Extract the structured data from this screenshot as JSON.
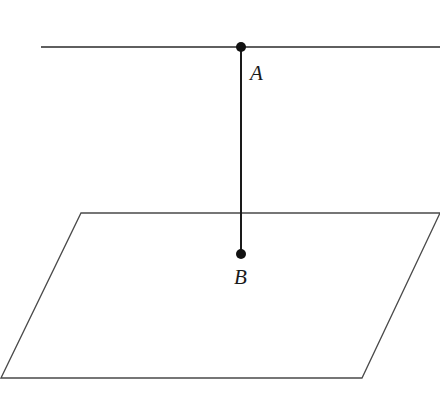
{
  "diagram": {
    "type": "geometry",
    "colors": {
      "stroke": "#2a2a2a",
      "plane_stroke": "#4a4a4a",
      "point_fill": "#111111",
      "background": "#ffffff"
    },
    "line": {
      "x1": 41,
      "y1": 47,
      "x2": 440,
      "y2": 47
    },
    "segment_AB": {
      "x1": 241,
      "y1": 47,
      "x2": 241,
      "y2": 254
    },
    "plane": {
      "points": "81,213 440,213 362,378 1,378"
    },
    "points": [
      {
        "id": "A",
        "label": "A",
        "cx": 241,
        "cy": 47,
        "r": 5,
        "label_x": 250,
        "label_y": 80
      },
      {
        "id": "B",
        "label": "B",
        "cx": 241,
        "cy": 254,
        "r": 5,
        "label_x": 234,
        "label_y": 284
      }
    ]
  }
}
